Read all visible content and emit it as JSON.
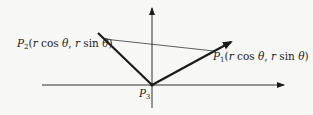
{
  "diagram": {
    "title": "",
    "points": {
      "P1": {
        "name": "P",
        "subscript": "1",
        "coords": "(r cos θ, r sin θ)",
        "r": "r",
        "cos": "cos",
        "sin": "sin",
        "theta": "θ"
      },
      "P2": {
        "name": "P",
        "subscript": "2",
        "coords": "(r cos θ, r sin θ)",
        "r": "r",
        "cos": "cos",
        "sin": "sin",
        "theta": "θ"
      },
      "P3": {
        "name": "P",
        "subscript": "3"
      }
    },
    "axes": {
      "x": "horizontal axis",
      "y": "vertical axis"
    },
    "colors": {
      "line": "#1a1a1a",
      "background": "#f7f7f6"
    }
  }
}
